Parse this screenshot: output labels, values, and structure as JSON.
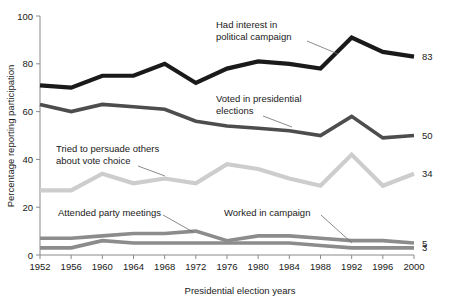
{
  "chart_data": {
    "type": "line",
    "title": "",
    "xlabel": "Presidential election years",
    "ylabel": "Percentage reporting participation",
    "categories": [
      1952,
      1956,
      1960,
      1964,
      1968,
      1972,
      1976,
      1980,
      1984,
      1988,
      1992,
      1996,
      2000
    ],
    "x_tick_labels": [
      "1952",
      "1956",
      "1960",
      "1964",
      "1968",
      "1972",
      "1976",
      "1980",
      "1984",
      "1988",
      "1992",
      "1996",
      "2000"
    ],
    "y_tick_labels": [
      "0",
      "20",
      "40",
      "60",
      "80",
      "100"
    ],
    "y_ticks": [
      0,
      20,
      40,
      60,
      80,
      100
    ],
    "ylim": [
      0,
      100
    ],
    "xlim": [
      1952,
      2000
    ],
    "grid": false,
    "legend": "none",
    "series": [
      {
        "name": "Had interest in political campaign",
        "color": "#1a1a1a",
        "width": 4.2,
        "end_label": "83",
        "values": [
          71,
          70,
          75,
          75,
          80,
          72,
          78,
          81,
          80,
          78,
          91,
          85,
          83
        ]
      },
      {
        "name": "Voted in presidential elections",
        "color": "#4d4d4d",
        "width": 3.6,
        "end_label": "50",
        "values": [
          63,
          60,
          63,
          62,
          61,
          56,
          54,
          53,
          52,
          50,
          58,
          49,
          50
        ]
      },
      {
        "name": "Tried to persuade others about vote choice",
        "color": "#cdcdcd",
        "width": 4.2,
        "end_label": "34",
        "values": [
          27,
          27,
          34,
          30,
          32,
          30,
          38,
          36,
          32,
          29,
          42,
          29,
          34
        ]
      },
      {
        "name": "Attended party meetings",
        "color": "#8c8c8c",
        "width": 3.6,
        "end_label": "5",
        "values": [
          7,
          7,
          8,
          9,
          9,
          10,
          6,
          8,
          8,
          7,
          6,
          6,
          5
        ]
      },
      {
        "name": "Worked in campaign",
        "color": "#8c8c8c",
        "width": 3.6,
        "end_label": "3",
        "values": [
          3,
          3,
          6,
          5,
          5,
          5,
          5,
          5,
          5,
          4,
          3,
          3,
          3
        ]
      }
    ],
    "annotations": [
      {
        "id": "had-interest",
        "lines": [
          "Had interest in",
          "political campaign"
        ],
        "text_x": 216,
        "text_y": 28,
        "leader": "M 307,41 L 338,54"
      },
      {
        "id": "voted-presidential",
        "lines": [
          "Voted in presidential",
          "elections"
        ],
        "text_x": 216,
        "text_y": 102,
        "leader": "M 263,116 L 292,127"
      },
      {
        "id": "tried-persuade",
        "lines": [
          "Tried to persuade others",
          "about vote choice"
        ],
        "text_x": 56,
        "text_y": 152,
        "leader": "M 138,166 L 165,176"
      },
      {
        "id": "attended-party-meetings",
        "lines": [
          "Attended party meetings"
        ],
        "text_x": 58,
        "text_y": 216,
        "leader": "M 163,215 L 193,232"
      },
      {
        "id": "worked-in-campaign",
        "lines": [
          "Worked in campaign"
        ],
        "text_x": 224,
        "text_y": 216,
        "leader": "M 321,215 L 352,243"
      }
    ]
  },
  "axes": {
    "y_axis_title": "Percentage reporting participation",
    "x_axis_title": "Presidential election years"
  }
}
